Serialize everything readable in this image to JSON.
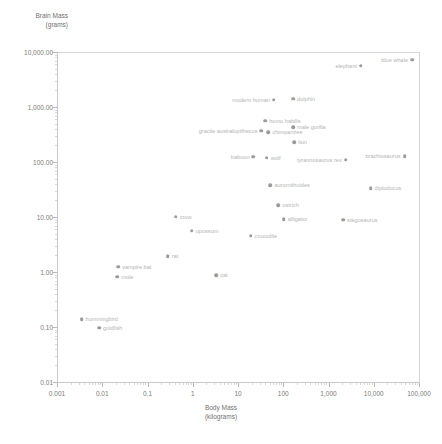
{
  "chart_data": {
    "type": "scatter",
    "title": "",
    "xlabel": "Body Mass\n(kilograms)",
    "ylabel": "Brain Mass\n(grams)",
    "xscale": "log",
    "yscale": "log",
    "xlim": [
      0.001,
      100000
    ],
    "ylim": [
      0.01,
      10000
    ],
    "grid": false,
    "legend": "none",
    "xticks": [
      "0.001",
      "0.01",
      "0.1",
      "1",
      "10",
      "100",
      "1,000",
      "10,000",
      "100,000"
    ],
    "xtick_values": [
      0.001,
      0.01,
      0.1,
      1,
      10,
      100,
      1000,
      10000,
      100000
    ],
    "yticks": [
      "0.01",
      "0.10",
      "1.00",
      "10.00",
      "100.00",
      "1,000.00",
      "10,000.00"
    ],
    "ytick_values": [
      0.01,
      0.1,
      1,
      10,
      100,
      1000,
      10000
    ],
    "points": [
      {
        "label": "hummingbird",
        "x": 0.0035,
        "y": 0.14,
        "side": "right"
      },
      {
        "label": "goldfish",
        "x": 0.0085,
        "y": 0.097,
        "side": "right"
      },
      {
        "label": "mole",
        "x": 0.0215,
        "y": 0.82,
        "side": "right"
      },
      {
        "label": "vampire bat",
        "x": 0.0225,
        "y": 1.25,
        "side": "right"
      },
      {
        "label": "rat",
        "x": 0.28,
        "y": 1.95,
        "side": "right"
      },
      {
        "label": "cat",
        "x": 3.3,
        "y": 0.88,
        "side": "right"
      },
      {
        "label": "crow",
        "x": 0.42,
        "y": 10.2,
        "side": "right"
      },
      {
        "label": "opossum",
        "x": 0.95,
        "y": 5.6,
        "side": "right"
      },
      {
        "label": "crocodile",
        "x": 19.0,
        "y": 4.6,
        "side": "right"
      },
      {
        "label": "alligator",
        "x": 103.0,
        "y": 9.2,
        "side": "right"
      },
      {
        "label": "ostrich",
        "x": 78.0,
        "y": 16.5,
        "side": "right"
      },
      {
        "label": "stegosaurus",
        "x": 2100.0,
        "y": 9.0,
        "side": "right"
      },
      {
        "label": "diplodocus",
        "x": 8500.0,
        "y": 33.0,
        "side": "right"
      },
      {
        "label": "aurornithoides",
        "x": 52.0,
        "y": 38.0,
        "side": "right"
      },
      {
        "label": "baboon",
        "x": 22.0,
        "y": 125.0,
        "side": "left"
      },
      {
        "label": "wolf",
        "x": 43.0,
        "y": 120.0,
        "side": "right"
      },
      {
        "label": "tyrannosaurus rex",
        "x": 2400.0,
        "y": 110.0,
        "side": "left"
      },
      {
        "label": "brachiosaurus",
        "x": 48000.0,
        "y": 126.0,
        "side": "left"
      },
      {
        "label": "lion",
        "x": 175.0,
        "y": 230.0,
        "side": "right"
      },
      {
        "label": "chimpanzee",
        "x": 47.0,
        "y": 350.0,
        "side": "right"
      },
      {
        "label": "gracile australopithecus",
        "x": 33.0,
        "y": 370.0,
        "side": "left"
      },
      {
        "label": "male gorilla",
        "x": 165.0,
        "y": 430.0,
        "side": "right"
      },
      {
        "label": "homo habilis",
        "x": 40.0,
        "y": 560.0,
        "side": "right"
      },
      {
        "label": "modern human",
        "x": 62.0,
        "y": 1350.0,
        "side": "left"
      },
      {
        "label": "dolphin",
        "x": 165.0,
        "y": 1420.0,
        "side": "right"
      },
      {
        "label": "elephant",
        "x": 5200.0,
        "y": 5600.0,
        "side": "left"
      },
      {
        "label": "blue whale",
        "x": 70000.0,
        "y": 7200.0,
        "side": "left"
      }
    ]
  },
  "axes": {
    "y_title": "Brain Mass\n(grams)",
    "x_title": "Body Mass\n(kilograms)"
  }
}
